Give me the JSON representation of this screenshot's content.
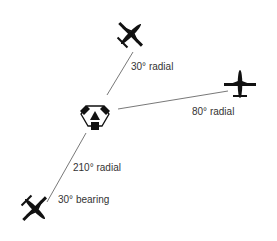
{
  "diagram": {
    "colors": {
      "line": "#555555",
      "aircraft": "#111111",
      "text": "#333333",
      "background": "#ffffff"
    },
    "station": {
      "icon": "vor-station-icon",
      "x": 95,
      "y": 117
    },
    "aircraft": [
      {
        "id": "aircraft-30-radial",
        "icon": "airplane-icon",
        "x": 130,
        "y": 35,
        "heading_deg": 45
      },
      {
        "id": "aircraft-80-radial",
        "icon": "airplane-icon",
        "x": 240,
        "y": 84,
        "heading_deg": 0
      },
      {
        "id": "aircraft-210-radial",
        "icon": "airplane-icon",
        "x": 35,
        "y": 210,
        "heading_deg": 30
      }
    ],
    "labels": {
      "radial_30": "30° radial",
      "radial_80": "80° radial",
      "radial_210": "210° radial",
      "bearing_30": "30° bearing"
    }
  }
}
